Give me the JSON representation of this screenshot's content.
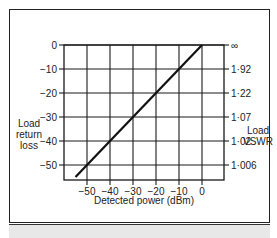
{
  "chart_data": {
    "type": "line",
    "title": "",
    "xlabel": "Detected power (dBm)",
    "ylabel": "Load return loss",
    "y2label": "Load VSWR",
    "xlim": [
      -60,
      10
    ],
    "ylim": [
      -55,
      0
    ],
    "x_ticks": [
      -50,
      -40,
      -30,
      -20,
      -10,
      0
    ],
    "x_tick_labels": [
      "−50",
      "−40",
      "−30",
      "−20",
      "−10",
      "0"
    ],
    "y_ticks": [
      0,
      -10,
      -20,
      -30,
      -40,
      -50
    ],
    "y_tick_labels": [
      "0",
      "−10",
      "−20",
      "−30",
      "−40",
      "−50"
    ],
    "y2_tick_labels": [
      "∞",
      "1·92",
      "1·22",
      "1·07",
      "1·02",
      "1·006"
    ],
    "grid": true,
    "legend": "none",
    "series": [
      {
        "name": "Return loss vs detected power",
        "x": [
          -55,
          0
        ],
        "y": [
          -55,
          0
        ]
      }
    ]
  },
  "labels": {
    "left_axis": [
      "Load",
      "return",
      "loss"
    ],
    "right_axis": [
      "Load",
      "VSWR"
    ],
    "bottom_axis": "Detected power (dBm)"
  }
}
